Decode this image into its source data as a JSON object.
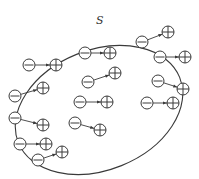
{
  "diagram": {
    "surface_label": "S",
    "colors": {
      "stroke": "#3a3a3a",
      "background": "#ffffff"
    },
    "surface": {
      "cx": 99,
      "cy": 110,
      "rx": 87,
      "ry": 60,
      "rotate": -22
    },
    "charge_radius": 6,
    "dipoles": [
      {
        "neg": [
          29,
          65
        ],
        "pos": [
          56,
          65
        ]
      },
      {
        "neg": [
          15,
          96
        ],
        "pos": [
          43,
          88
        ]
      },
      {
        "neg": [
          15,
          118
        ],
        "pos": [
          43,
          125
        ]
      },
      {
        "neg": [
          20,
          144
        ],
        "pos": [
          46,
          144
        ]
      },
      {
        "neg": [
          38,
          160
        ],
        "pos": [
          62,
          152
        ]
      },
      {
        "neg": [
          85,
          53
        ],
        "pos": [
          110,
          53
        ]
      },
      {
        "neg": [
          88,
          82
        ],
        "pos": [
          115,
          73
        ]
      },
      {
        "neg": [
          80,
          102
        ],
        "pos": [
          107,
          102
        ]
      },
      {
        "neg": [
          75,
          123
        ],
        "pos": [
          100,
          130
        ]
      },
      {
        "neg": [
          142,
          42
        ],
        "pos": [
          168,
          32
        ]
      },
      {
        "neg": [
          160,
          57
        ],
        "pos": [
          185,
          57
        ]
      },
      {
        "neg": [
          158,
          81
        ],
        "pos": [
          183,
          89
        ]
      },
      {
        "neg": [
          147,
          103
        ],
        "pos": [
          173,
          103
        ]
      }
    ]
  }
}
